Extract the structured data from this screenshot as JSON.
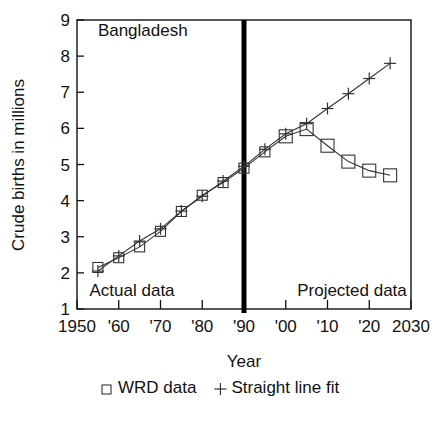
{
  "chart_data": {
    "type": "line",
    "title": "Bangladesh",
    "xlabel": "Year",
    "ylabel": "Crude births in millions",
    "xlim": [
      1950,
      2030
    ],
    "ylim": [
      1,
      9
    ],
    "grid": false,
    "legend_position": "bottom",
    "x_ticks": [
      1950,
      1960,
      1970,
      1980,
      1990,
      2000,
      2010,
      2020,
      2030
    ],
    "x_tick_labels": [
      "1950",
      "'60",
      "'70",
      "'80",
      "'90",
      "'00",
      "'10",
      "'20",
      "2030"
    ],
    "y_ticks": [
      1,
      2,
      3,
      4,
      5,
      6,
      7,
      8,
      9
    ],
    "y_tick_labels": [
      "1",
      "2",
      "3",
      "4",
      "5",
      "6",
      "7",
      "8",
      "9"
    ],
    "annotations": [
      {
        "text": "Bangladesh",
        "x": 1955,
        "y": 8.55,
        "anchor": "start"
      },
      {
        "text": "Actual data",
        "x": 1953,
        "y": 1.35,
        "anchor": "start"
      },
      {
        "text": "Projected data",
        "x": 2029,
        "y": 1.35,
        "anchor": "end"
      }
    ],
    "reference_line": {
      "label": "1990 actual/projected divider",
      "x": 1990,
      "orientation": "vertical",
      "color": "#000000"
    },
    "series": [
      {
        "name": "WRD data",
        "marker": "square",
        "x": [
          1955,
          1960,
          1965,
          1970,
          1975,
          1980,
          1985,
          1990,
          1995,
          2000,
          2005,
          2010,
          2015,
          2020,
          2025
        ],
        "values": [
          2.15,
          2.42,
          2.72,
          3.15,
          3.7,
          4.15,
          4.5,
          4.9,
          5.35,
          5.78,
          5.98,
          5.52,
          5.08,
          4.83,
          4.7
        ]
      },
      {
        "name": "Straight line fit",
        "marker": "plus",
        "x": [
          1955,
          1960,
          1965,
          1970,
          1975,
          1980,
          1985,
          1990,
          1995,
          2000,
          2005,
          2010,
          2015,
          2020,
          2025
        ],
        "values": [
          2.05,
          2.47,
          2.88,
          3.22,
          3.71,
          4.12,
          4.54,
          4.95,
          5.42,
          5.85,
          6.13,
          6.55,
          6.96,
          7.38,
          7.8
        ]
      }
    ]
  },
  "legend": {
    "entries": [
      {
        "symbol": "square",
        "label": "WRD data"
      },
      {
        "symbol": "plus",
        "label": "Straight line fit"
      }
    ]
  }
}
